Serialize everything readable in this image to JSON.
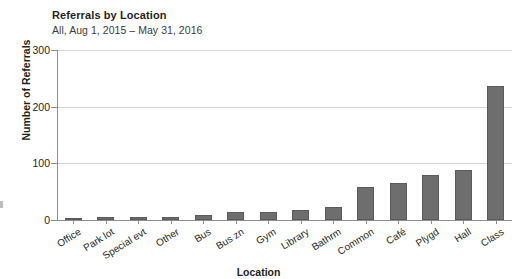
{
  "chart_data": {
    "type": "bar",
    "title": "Referrals by Location",
    "subtitle": "All, Aug 1, 2015 – May 31, 2016",
    "xlabel": "Location",
    "ylabel": "Number of Referrals",
    "ylim": [
      0,
      300
    ],
    "yticks": [
      0,
      100,
      200,
      300
    ],
    "grid": true,
    "legend": "none",
    "bar_color": "#6e6e6e",
    "categories": [
      "Office",
      "Park lot",
      "Special evt",
      "Other",
      "Bus",
      "Bus zn",
      "Gym",
      "Library",
      "Bathrm",
      "Common",
      "Café",
      "Plygd",
      "Hall",
      "Class"
    ],
    "values": [
      4,
      5,
      5,
      6,
      9,
      15,
      15,
      17,
      23,
      59,
      65,
      80,
      88,
      236
    ]
  },
  "axis": {
    "ytick_labels": [
      "300",
      "200",
      "100",
      "0"
    ],
    "x_title": "Location",
    "y_title": "Number of Referrals"
  }
}
